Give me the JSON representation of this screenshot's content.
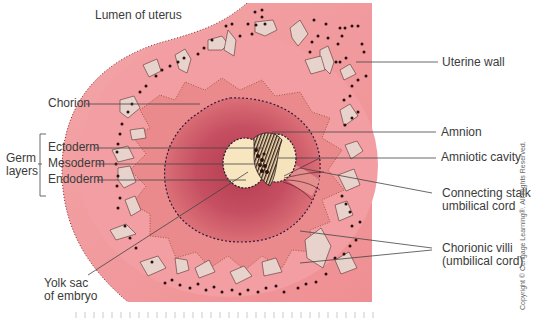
{
  "figure": {
    "type": "anatomical-diagram",
    "colors": {
      "uterine_wall": "#f09a9c",
      "decidua": "#ee8e94",
      "chorion_ring": "#e58a88",
      "amniotic_region": "#c24a5a",
      "yolk_sac": "#f7e6bf",
      "villi": "#e7d2cc",
      "dots": "#2a1010",
      "label_lines": "#444444"
    }
  },
  "labels": {
    "lumen": "Lumen of uterus",
    "uterine_wall": "Uterine wall",
    "chorion": "Chorion",
    "germ_layers": "Germ\nlayers",
    "ectoderm": "Ectoderm",
    "mesoderm": "Mesoderm",
    "endoderm": "Endoderm",
    "amnion": "Amnion",
    "amniotic_cavity": "Amniotic cavity",
    "connecting_stalk": "Connecting stalk\numbilical cord",
    "chorionic_villi": "Chorionic villi\n(umbilical cord)",
    "yolk_sac": "Yolk sac\nof embryo"
  },
  "copyright": "Copyright © Cengage Learning®. All Rights Reserved."
}
